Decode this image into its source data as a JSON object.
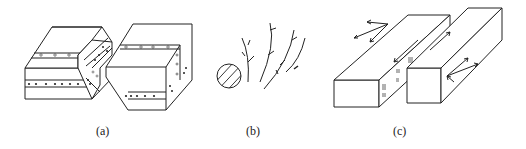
{
  "figure": {
    "panels": [
      {
        "id": "a",
        "label": "(a)",
        "description": "Offset layered blocks with dotted marker beds across fault zone"
      },
      {
        "id": "b",
        "label": "(b)",
        "description": "Hatched circle with branching curved fracture traces"
      },
      {
        "id": "c",
        "label": "(c)",
        "description": "Two elongated blocks with slip arrows and striation marks"
      }
    ]
  },
  "colors": {
    "line": "#222222",
    "background": "#ffffff"
  }
}
